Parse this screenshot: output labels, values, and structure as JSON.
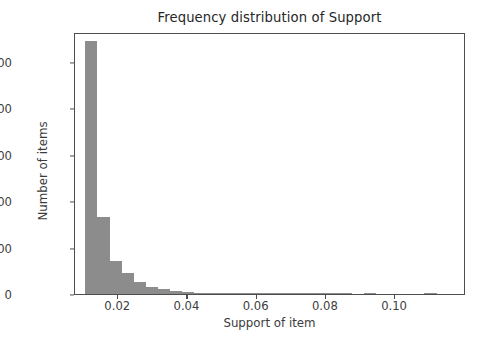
{
  "chart_data": {
    "type": "bar",
    "title": "Frequency distribution of Support",
    "xlabel": "Support of item",
    "ylabel": "Number of items",
    "xlim": [
      0.0075,
      0.1205
    ],
    "ylim": [
      0,
      2820
    ],
    "grid": false,
    "legend": null,
    "bar_color": "#8c8c8c",
    "axis_color": "#4d4d4d",
    "background": "#ffffff",
    "bin_width": 0.0035,
    "xticks": [
      {
        "value": 0.02,
        "label": "0.02"
      },
      {
        "value": 0.04,
        "label": "0.04"
      },
      {
        "value": 0.06,
        "label": "0.06"
      },
      {
        "value": 0.08,
        "label": "0.08"
      },
      {
        "value": 0.1,
        "label": "0.10"
      }
    ],
    "yticks": [
      {
        "value": 0,
        "label": "0"
      },
      {
        "value": 500,
        "label": "500"
      },
      {
        "value": 1000,
        "label": "1000"
      },
      {
        "value": 1500,
        "label": "1500"
      },
      {
        "value": 2000,
        "label": "2000"
      },
      {
        "value": 2500,
        "label": "2500"
      }
    ],
    "bins": [
      {
        "x0": 0.0105,
        "x1": 0.014,
        "value": 2720
      },
      {
        "x0": 0.014,
        "x1": 0.0175,
        "value": 830
      },
      {
        "x0": 0.0175,
        "x1": 0.021,
        "value": 360
      },
      {
        "x0": 0.021,
        "x1": 0.0245,
        "value": 225
      },
      {
        "x0": 0.0245,
        "x1": 0.028,
        "value": 130
      },
      {
        "x0": 0.028,
        "x1": 0.0315,
        "value": 80
      },
      {
        "x0": 0.0315,
        "x1": 0.035,
        "value": 55
      },
      {
        "x0": 0.035,
        "x1": 0.0385,
        "value": 35
      },
      {
        "x0": 0.0385,
        "x1": 0.042,
        "value": 22
      },
      {
        "x0": 0.042,
        "x1": 0.0455,
        "value": 14
      },
      {
        "x0": 0.0455,
        "x1": 0.049,
        "value": 10
      },
      {
        "x0": 0.049,
        "x1": 0.0525,
        "value": 7
      },
      {
        "x0": 0.0525,
        "x1": 0.056,
        "value": 5
      },
      {
        "x0": 0.056,
        "x1": 0.0595,
        "value": 4
      },
      {
        "x0": 0.0595,
        "x1": 0.063,
        "value": 3
      },
      {
        "x0": 0.063,
        "x1": 0.0665,
        "value": 2
      },
      {
        "x0": 0.0665,
        "x1": 0.07,
        "value": 2
      },
      {
        "x0": 0.07,
        "x1": 0.0735,
        "value": 1
      },
      {
        "x0": 0.0735,
        "x1": 0.077,
        "value": 1
      },
      {
        "x0": 0.077,
        "x1": 0.0805,
        "value": 1
      },
      {
        "x0": 0.0805,
        "x1": 0.084,
        "value": 1
      },
      {
        "x0": 0.084,
        "x1": 0.0875,
        "value": 1
      },
      {
        "x0": 0.0875,
        "x1": 0.091,
        "value": 0
      },
      {
        "x0": 0.091,
        "x1": 0.0945,
        "value": 1
      },
      {
        "x0": 0.0945,
        "x1": 0.098,
        "value": 0
      },
      {
        "x0": 0.098,
        "x1": 0.1015,
        "value": 0
      },
      {
        "x0": 0.1015,
        "x1": 0.105,
        "value": 0
      },
      {
        "x0": 0.105,
        "x1": 0.1085,
        "value": 0
      },
      {
        "x0": 0.1085,
        "x1": 0.112,
        "value": 1
      }
    ]
  }
}
